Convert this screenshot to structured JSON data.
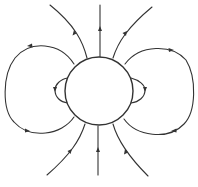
{
  "diagram": {
    "title": "",
    "colors": {
      "line": "#333333",
      "background": "#ffffff"
    },
    "sphere": {
      "cx": 99,
      "cy": 91,
      "r": 34
    },
    "labels": []
  }
}
